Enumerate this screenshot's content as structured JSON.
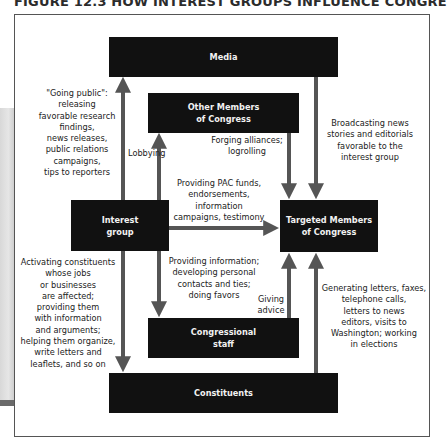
{
  "figure": {
    "title": "FIGURE 12.3  HOW INTEREST GROUPS INFLUENCE CONGRESS"
  },
  "nodes": {
    "media": "Media",
    "other_members": "Other Members\nof Congress",
    "interest_group": "Interest\ngroup",
    "targeted_members": "Targeted Members\nof Congress",
    "congressional_staff": "Congressional\nstaff",
    "constituents": "Constituents"
  },
  "edges": [
    {
      "from": "Interest group",
      "to": "Media",
      "label": "\"Going public\":\nreleasing\nfavorable research\nfindings,\nnews releases,\npublic relations\ncampaigns,\ntips to reporters"
    },
    {
      "from": "Interest group",
      "to": "Other Members of Congress",
      "label": "Lobbying"
    },
    {
      "from": "Other Members of Congress",
      "to": "Targeted Members of Congress",
      "label": "Forging alliances;\nlogrolling"
    },
    {
      "from": "Media",
      "to": "Targeted Members of Congress",
      "label": "Broadcasting news\nstories and editorials\nfavorable to the\ninterest group"
    },
    {
      "from": "Interest group",
      "to": "Targeted Members of Congress",
      "label": "Providing PAC funds,\nendorsements,\ninformation\ncampaigns, testimony"
    },
    {
      "from": "Interest group",
      "to": "Congressional staff",
      "label": "Providing information;\ndeveloping personal\ncontacts and ties;\ndoing favors"
    },
    {
      "from": "Congressional staff",
      "to": "Targeted Members of Congress",
      "label": "Giving\nadvice"
    },
    {
      "from": "Interest group",
      "to": "Constituents",
      "label": "Activating constituents\nwhose jobs\nor businesses\nare affected;\nproviding them\nwith information\nand arguments;\nhelping them organize,\nwrite letters and\nleaflets, and so on"
    },
    {
      "from": "Constituents",
      "to": "Targeted Members of Congress",
      "label": "Generating letters, faxes,\ntelephone calls,\nletters to news\neditors, visits to\nWashington; working\nin elections"
    }
  ],
  "colors": {
    "box": "#111111",
    "box_text": "#f2f2f2",
    "arrow": "#555555"
  }
}
